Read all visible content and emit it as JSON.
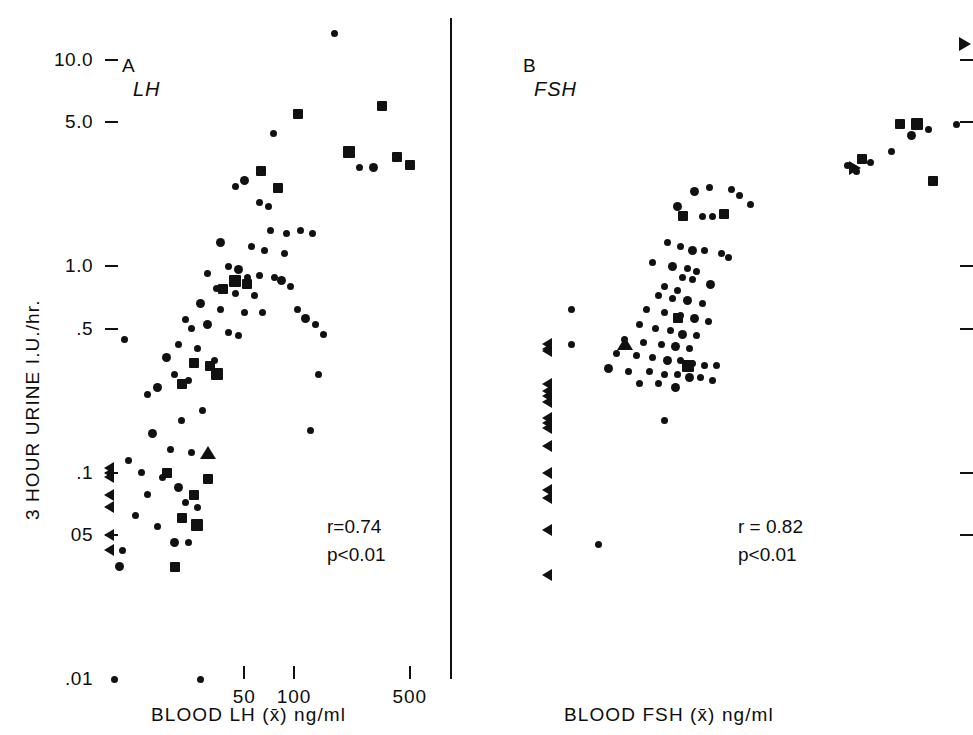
{
  "figure": {
    "y_axis_title": "3 HOUR URINE  I.U./hr.",
    "y_tick_labels": [
      "10.0",
      "5.0",
      "1.0",
      ".5",
      ".1",
      "05",
      ".01"
    ],
    "x_tick_labels": [
      "50",
      "100",
      "500"
    ]
  },
  "panelA": {
    "letter": "A",
    "analyte": "LH",
    "x_title": "BLOOD LH (x̄) ng/ml",
    "stat_r": "r=0.74",
    "stat_p": "p<0.01"
  },
  "panelB": {
    "letter": "B",
    "analyte": "FSH",
    "x_title": "BLOOD FSH (x̄) ng/ml",
    "stat_r": "r = 0.82",
    "stat_p": "p<0.01"
  },
  "chart_data": [
    {
      "type": "scatter",
      "panel": "A",
      "title": "A  LH",
      "xlabel": "BLOOD LH (x̄) ng/ml",
      "ylabel": "3 HOUR URINE  I.U./hr.",
      "xscale": "log",
      "yscale": "log",
      "xlim": [
        7,
        900
      ],
      "ylim": [
        0.01,
        16
      ],
      "xticks": [
        50,
        100,
        500
      ],
      "yticks": [
        10.0,
        5.0,
        1.0,
        0.5,
        0.1,
        0.05,
        0.01
      ],
      "grid": false,
      "legend": null,
      "annotations": [
        "r=0.74",
        "p<0.01"
      ],
      "correlation_r": 0.74,
      "p_value": "<0.01",
      "marker_meaning": {
        "circle": "individual subject",
        "square": "subject, second marker class",
        "tri-left": "value below detection limit (censored low)",
        "tri-right": "value above range (censored high)",
        "tri-up": "value above vertical range"
      },
      "series": [
        {
          "name": "circle",
          "marker": "circle",
          "points": [
            [
              175,
              13.5
            ],
            [
              75,
              4.4
            ],
            [
              50,
              2.6
            ],
            [
              44,
              2.45
            ],
            [
              62,
              2.05
            ],
            [
              70,
              1.95
            ],
            [
              250,
              3.0
            ],
            [
              300,
              3.0
            ],
            [
              72,
              1.5
            ],
            [
              90,
              1.45
            ],
            [
              110,
              1.5
            ],
            [
              130,
              1.45
            ],
            [
              36,
              1.3
            ],
            [
              55,
              1.25
            ],
            [
              66,
              1.2
            ],
            [
              88,
              1.15
            ],
            [
              40,
              1.0
            ],
            [
              46,
              0.97
            ],
            [
              30,
              0.92
            ],
            [
              52,
              0.88
            ],
            [
              62,
              0.9
            ],
            [
              76,
              0.88
            ],
            [
              84,
              0.85
            ],
            [
              95,
              0.8
            ],
            [
              34,
              0.78
            ],
            [
              44,
              0.74
            ],
            [
              58,
              0.72
            ],
            [
              27,
              0.66
            ],
            [
              36,
              0.62
            ],
            [
              50,
              0.6
            ],
            [
              64,
              0.6
            ],
            [
              22,
              0.55
            ],
            [
              30,
              0.52
            ],
            [
              24,
              0.5
            ],
            [
              40,
              0.48
            ],
            [
              46,
              0.46
            ],
            [
              105,
              0.62
            ],
            [
              118,
              0.56
            ],
            [
              135,
              0.52
            ],
            [
              150,
              0.47
            ],
            [
              20,
              0.42
            ],
            [
              26,
              0.4
            ],
            [
              17,
              0.36
            ],
            [
              33,
              0.35
            ],
            [
              140,
              0.3
            ],
            [
              19,
              0.3
            ],
            [
              23,
              0.28
            ],
            [
              15,
              0.26
            ],
            [
              13,
              0.24
            ],
            [
              125,
              0.16
            ],
            [
              28,
              0.2
            ],
            [
              21,
              0.18
            ],
            [
              14,
              0.155
            ],
            [
              18,
              0.13
            ],
            [
              24,
              0.125
            ],
            [
              12,
              0.1
            ],
            [
              16,
              0.095
            ],
            [
              20,
              0.085
            ],
            [
              13,
              0.078
            ],
            [
              22,
              0.072
            ],
            [
              26,
              0.068
            ],
            [
              15,
              0.055
            ],
            [
              19,
              0.046
            ],
            [
              23,
              0.046
            ],
            [
              11,
              0.062
            ],
            [
              10,
              0.115
            ],
            [
              9.5,
              0.44
            ],
            [
              8.8,
              0.035
            ],
            [
              9.2,
              0.042
            ],
            [
              8.2,
              0.01
            ],
            [
              27,
              0.01
            ]
          ]
        },
        {
          "name": "square",
          "marker": "square",
          "points": [
            [
              105,
              5.5
            ],
            [
              340,
              6.0
            ],
            [
              215,
              3.6
            ],
            [
              420,
              3.4
            ],
            [
              505,
              3.1
            ],
            [
              63,
              2.9
            ],
            [
              80,
              2.4
            ],
            [
              44,
              0.85
            ],
            [
              52,
              0.82
            ],
            [
              37,
              0.78
            ],
            [
              25,
              0.34
            ],
            [
              31,
              0.33
            ],
            [
              34,
              0.3
            ],
            [
              21,
              0.27
            ],
            [
              17,
              0.1
            ],
            [
              30,
              0.093
            ],
            [
              25,
              0.078
            ],
            [
              26,
              0.056
            ],
            [
              21,
              0.06
            ],
            [
              19,
              0.035
            ]
          ]
        },
        {
          "name": "tri-left",
          "marker": "tri-left",
          "points": [
            [
              8.2,
              0.105
            ],
            [
              8.2,
              0.1
            ],
            [
              8.2,
              0.095
            ],
            [
              8.2,
              0.078
            ],
            [
              8.2,
              0.068
            ],
            [
              8.2,
              0.05
            ],
            [
              8.2,
              0.042
            ]
          ]
        },
        {
          "name": "tri-up",
          "marker": "tri-up",
          "points": [
            [
              30,
              0.125
            ]
          ]
        }
      ]
    },
    {
      "type": "scatter",
      "panel": "B",
      "title": "B  FSH",
      "xlabel": "BLOOD FSH (x̄) ng/ml",
      "ylabel": "3 HOUR URINE  I.U./hr.",
      "xscale": "log",
      "yscale": "log",
      "xlim": [
        20,
        1100
      ],
      "ylim": [
        0.01,
        16
      ],
      "xticks": [
        50,
        100,
        500
      ],
      "yticks": [
        10.0,
        5.0,
        1.0,
        0.5,
        0.1,
        0.05,
        0.01
      ],
      "grid": false,
      "legend": null,
      "annotations": [
        "r = 0.82",
        "p<0.01"
      ],
      "correlation_r": 0.82,
      "p_value": "<0.01",
      "series": [
        {
          "name": "circle",
          "marker": "circle",
          "points": [
            [
              960,
              4.9
            ],
            [
              760,
              4.6
            ],
            [
              660,
              4.3
            ],
            [
              560,
              3.6
            ],
            [
              470,
              3.2
            ],
            [
              420,
              2.9
            ],
            [
              390,
              3.1
            ],
            [
              110,
              2.3
            ],
            [
              125,
              2.4
            ],
            [
              150,
              2.35
            ],
            [
              160,
              2.2
            ],
            [
              175,
              2.0
            ],
            [
              96,
              1.95
            ],
            [
              118,
              1.75
            ],
            [
              128,
              1.75
            ],
            [
              88,
              1.3
            ],
            [
              98,
              1.25
            ],
            [
              108,
              1.2
            ],
            [
              120,
              1.2
            ],
            [
              138,
              1.15
            ],
            [
              146,
              1.1
            ],
            [
              78,
              1.05
            ],
            [
              92,
              1.0
            ],
            [
              104,
              0.98
            ],
            [
              112,
              0.95
            ],
            [
              100,
              0.88
            ],
            [
              108,
              0.86
            ],
            [
              126,
              0.82
            ],
            [
              86,
              0.8
            ],
            [
              96,
              0.76
            ],
            [
              82,
              0.72
            ],
            [
              92,
              0.7
            ],
            [
              104,
              0.68
            ],
            [
              118,
              0.66
            ],
            [
              74,
              0.62
            ],
            [
              86,
              0.6
            ],
            [
              98,
              0.58
            ],
            [
              110,
              0.56
            ],
            [
              124,
              0.54
            ],
            [
              70,
              0.52
            ],
            [
              80,
              0.5
            ],
            [
              90,
              0.49
            ],
            [
              100,
              0.47
            ],
            [
              112,
              0.46
            ],
            [
              62,
              0.44
            ],
            [
              72,
              0.43
            ],
            [
              84,
              0.42
            ],
            [
              94,
              0.41
            ],
            [
              106,
              0.4
            ],
            [
              58,
              0.38
            ],
            [
              68,
              0.37
            ],
            [
              78,
              0.36
            ],
            [
              88,
              0.35
            ],
            [
              98,
              0.35
            ],
            [
              108,
              0.34
            ],
            [
              120,
              0.33
            ],
            [
              132,
              0.33
            ],
            [
              54,
              0.32
            ],
            [
              64,
              0.31
            ],
            [
              76,
              0.31
            ],
            [
              86,
              0.3
            ],
            [
              96,
              0.3
            ],
            [
              106,
              0.29
            ],
            [
              116,
              0.29
            ],
            [
              128,
              0.28
            ],
            [
              70,
              0.27
            ],
            [
              82,
              0.27
            ],
            [
              94,
              0.26
            ],
            [
              40,
              0.42
            ],
            [
              40,
              0.62
            ],
            [
              86,
              0.18
            ],
            [
              50,
              0.045
            ]
          ]
        },
        {
          "name": "square",
          "marker": "square",
          "points": [
            [
              440,
              3.3
            ],
            [
              600,
              4.9
            ],
            [
              690,
              4.9
            ],
            [
              790,
              2.6
            ],
            [
              100,
              1.75
            ],
            [
              140,
              1.8
            ],
            [
              96,
              0.56
            ],
            [
              104,
              0.33
            ]
          ]
        },
        {
          "name": "tri-left",
          "marker": "tri-left",
          "points": [
            [
              34,
              0.42
            ],
            [
              34,
              0.4
            ],
            [
              34,
              0.39
            ],
            [
              34,
              0.27
            ],
            [
              34,
              0.25
            ],
            [
              34,
              0.235
            ],
            [
              34,
              0.22
            ],
            [
              34,
              0.185
            ],
            [
              34,
              0.175
            ],
            [
              34,
              0.165
            ],
            [
              34,
              0.135
            ],
            [
              34,
              0.1
            ],
            [
              34,
              0.082
            ],
            [
              34,
              0.075
            ],
            [
              34,
              0.053
            ],
            [
              34,
              0.032
            ]
          ]
        },
        {
          "name": "tri-right",
          "marker": "tri-right",
          "points": [
            [
              1000,
              12.0
            ],
            [
              400,
              3.0
            ]
          ]
        },
        {
          "name": "tri-up",
          "marker": "tri-up",
          "points": [
            [
              62,
              0.42
            ]
          ]
        }
      ]
    }
  ]
}
